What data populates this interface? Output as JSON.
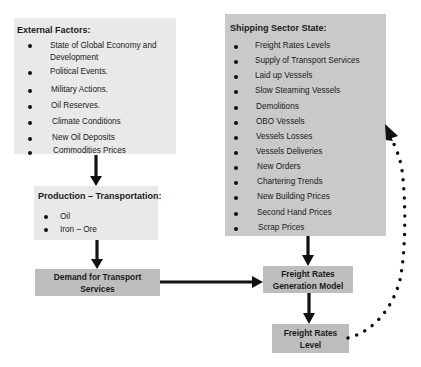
{
  "external_factors": {
    "title": "External Factors:",
    "items": [
      "State of Global Economy and",
      "Development",
      "Political Events.",
      "Military Actions.",
      "Oil Reserves.",
      "Climate  Conditions",
      "New Oil Deposits",
      "Commodities Prices"
    ]
  },
  "production_transportation": {
    "title": "Production – Transportation:",
    "items": [
      "Oil",
      "Iron – Ore"
    ]
  },
  "demand": {
    "line1": "Demand for Transport",
    "line2": "Services"
  },
  "shipping_sector": {
    "title": "Shipping Sector State:",
    "items": [
      "Freight Rates Levels",
      "Supply of Transport Services",
      "Laid up Vessels",
      "Slow Steaming Vessels",
      "Demolitions",
      "OBO Vessels",
      "Vessels Losses",
      "Vessels Deliveries",
      "New Orders",
      "Chartering Trends",
      "New Building Prices",
      "Second Hand Prices",
      "Scrap Prices"
    ]
  },
  "generation_model": {
    "line1": "Freight Rates",
    "line2": "Generation Model"
  },
  "rates_level": {
    "line1": "Freight Rates",
    "line2": "Level"
  },
  "colors": {
    "light_box": "#e9e9e9",
    "mid_box": "#c9c9c9",
    "dark_box": "#bdbdbd",
    "arrow": "#111111"
  }
}
